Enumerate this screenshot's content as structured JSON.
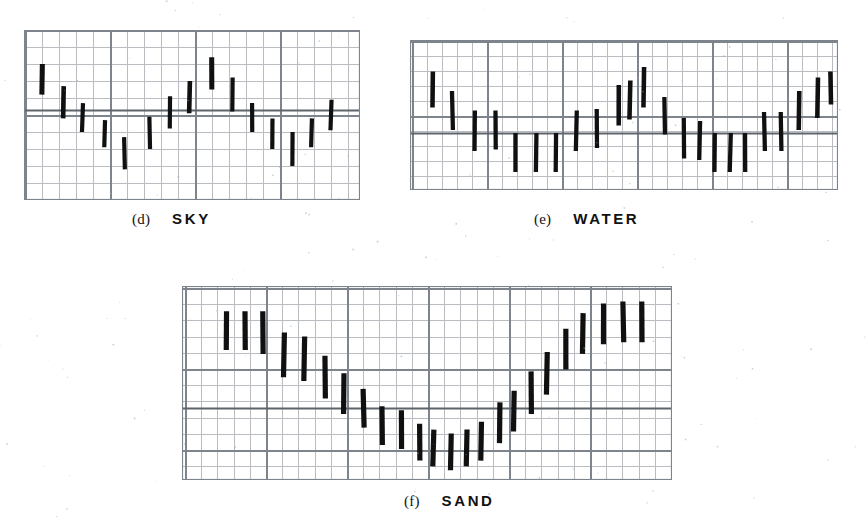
{
  "figure": {
    "background_color": "#ffffff",
    "ink_color": "#101010",
    "grid_minor_color": "#b9bdc2",
    "grid_major_color": "#7e848b",
    "rule_color": "#5e646b"
  },
  "panels": [
    {
      "id": "sky",
      "tag": "(d)",
      "name": "SKY",
      "caption_x": 132,
      "caption_y": 210,
      "box": {
        "x": 24,
        "y": 30,
        "w": 336,
        "h": 170
      },
      "grid": {
        "minor": 17.0,
        "major_every": 5,
        "major_offset_x": 1,
        "major_offset_y": 0
      },
      "baseline_y_frac": 0.47,
      "chart_note": "Vertical range (min-max) bars, one per sample column."
    },
    {
      "id": "water",
      "tag": "(e)",
      "name": "WATER",
      "caption_x": 534,
      "caption_y": 210,
      "box": {
        "x": 410,
        "y": 40,
        "w": 428,
        "h": 150
      },
      "grid": {
        "minor": 15.0,
        "major_every": 5,
        "major_offset_x": 2,
        "major_offset_y": 1
      },
      "baseline_y_frac": 0.62,
      "chart_note": "Vertical range (min-max) bars, one per sample column."
    },
    {
      "id": "sand",
      "tag": "(f)",
      "name": "SAND",
      "caption_x": 404,
      "caption_y": 492,
      "box": {
        "x": 182,
        "y": 286,
        "w": 490,
        "h": 194
      },
      "grid": {
        "minor": 16.2,
        "major_every": 5,
        "major_offset_x": 3,
        "major_offset_y": 2
      },
      "baseline_y_frac": 0.63,
      "chart_note": "Vertical range (min-max) bars, one per sample column; monotone V shape."
    }
  ],
  "chart_data": [
    {
      "id": "sky",
      "type": "bar",
      "title": "SKY",
      "subtitle": "(d)",
      "xlabel": "",
      "ylabel": "",
      "grid": true,
      "legend": "none",
      "bar_style": "vertical range bar (low-high whisker)",
      "ylim": [
        0,
        1
      ],
      "xlim": [
        0,
        20
      ],
      "categories": [
        1,
        2,
        3,
        4,
        5,
        6,
        7,
        8,
        9,
        10,
        11,
        12,
        13,
        14,
        15,
        16,
        17
      ],
      "series": [
        {
          "name": "range_low",
          "values": [
            0.38,
            0.47,
            0.56,
            0.64,
            0.74,
            0.62,
            0.52,
            0.47,
            0.33,
            0.43,
            0.56,
            0.65,
            0.72,
            0.79,
            0.69,
            0.63,
            0.56
          ]
        },
        {
          "name": "range_high",
          "values": [
            0.2,
            0.33,
            0.43,
            0.52,
            0.59,
            0.48,
            0.35,
            0.29,
            0.18,
            0.29,
            0.42,
            0.51,
            0.59,
            0.65,
            0.56,
            0.49,
            0.4
          ]
        }
      ],
      "bars": [
        {
          "x": 0.055,
          "top": 0.2,
          "bottom": 0.38,
          "w": 0.012
        },
        {
          "x": 0.118,
          "top": 0.33,
          "bottom": 0.52,
          "w": 0.011
        },
        {
          "x": 0.175,
          "top": 0.43,
          "bottom": 0.6,
          "w": 0.01
        },
        {
          "x": 0.24,
          "top": 0.53,
          "bottom": 0.69,
          "w": 0.01
        },
        {
          "x": 0.3,
          "top": 0.63,
          "bottom": 0.82,
          "w": 0.01
        },
        {
          "x": 0.375,
          "top": 0.51,
          "bottom": 0.7,
          "w": 0.01
        },
        {
          "x": 0.435,
          "top": 0.39,
          "bottom": 0.58,
          "w": 0.01
        },
        {
          "x": 0.492,
          "top": 0.3,
          "bottom": 0.49,
          "w": 0.011
        },
        {
          "x": 0.558,
          "top": 0.16,
          "bottom": 0.35,
          "w": 0.012
        },
        {
          "x": 0.62,
          "top": 0.28,
          "bottom": 0.48,
          "w": 0.01
        },
        {
          "x": 0.68,
          "top": 0.43,
          "bottom": 0.6,
          "w": 0.01
        },
        {
          "x": 0.74,
          "top": 0.52,
          "bottom": 0.7,
          "w": 0.01
        },
        {
          "x": 0.8,
          "top": 0.6,
          "bottom": 0.8,
          "w": 0.01
        },
        {
          "x": 0.857,
          "top": 0.52,
          "bottom": 0.69,
          "w": 0.01
        },
        {
          "x": 0.915,
          "top": 0.41,
          "bottom": 0.59,
          "w": 0.01
        }
      ]
    },
    {
      "id": "water",
      "type": "bar",
      "title": "WATER",
      "subtitle": "(e)",
      "xlabel": "",
      "ylabel": "",
      "grid": true,
      "legend": "none",
      "bar_style": "vertical range bar (low-high whisker)",
      "ylim": [
        0,
        1
      ],
      "xlim": [
        0,
        24
      ],
      "categories": [
        1,
        2,
        3,
        4,
        5,
        6,
        7,
        8,
        9,
        10,
        11,
        12,
        13,
        14,
        15,
        16,
        17,
        18,
        19,
        20,
        21,
        22
      ],
      "series": [
        {
          "name": "range_low",
          "values": [
            0.48,
            0.6,
            0.74,
            0.76,
            0.88,
            0.87,
            0.87,
            0.76,
            0.74,
            0.56,
            0.52,
            0.64,
            0.83,
            0.84,
            0.83,
            0.88,
            0.88,
            0.88,
            0.74,
            0.74,
            0.6,
            0.53
          ]
        },
        {
          "name": "range_high",
          "values": [
            0.23,
            0.36,
            0.5,
            0.52,
            0.65,
            0.64,
            0.64,
            0.5,
            0.48,
            0.3,
            0.26,
            0.39,
            0.58,
            0.59,
            0.59,
            0.64,
            0.64,
            0.64,
            0.49,
            0.49,
            0.34,
            0.26
          ]
        }
      ],
      "bars": [
        {
          "x": 0.052,
          "top": 0.21,
          "bottom": 0.45,
          "w": 0.0085
        },
        {
          "x": 0.1,
          "top": 0.34,
          "bottom": 0.6,
          "w": 0.008
        },
        {
          "x": 0.152,
          "top": 0.47,
          "bottom": 0.74,
          "w": 0.008
        },
        {
          "x": 0.2,
          "top": 0.47,
          "bottom": 0.73,
          "w": 0.008
        },
        {
          "x": 0.246,
          "top": 0.62,
          "bottom": 0.88,
          "w": 0.008
        },
        {
          "x": 0.294,
          "top": 0.62,
          "bottom": 0.88,
          "w": 0.008
        },
        {
          "x": 0.34,
          "top": 0.62,
          "bottom": 0.88,
          "w": 0.008
        },
        {
          "x": 0.388,
          "top": 0.47,
          "bottom": 0.74,
          "w": 0.008
        },
        {
          "x": 0.436,
          "top": 0.46,
          "bottom": 0.72,
          "w": 0.008
        },
        {
          "x": 0.487,
          "top": 0.3,
          "bottom": 0.57,
          "w": 0.0085
        },
        {
          "x": 0.513,
          "top": 0.27,
          "bottom": 0.53,
          "w": 0.0085
        },
        {
          "x": 0.546,
          "top": 0.18,
          "bottom": 0.45,
          "w": 0.0085
        },
        {
          "x": 0.594,
          "top": 0.38,
          "bottom": 0.63,
          "w": 0.008
        },
        {
          "x": 0.64,
          "top": 0.52,
          "bottom": 0.79,
          "w": 0.008
        },
        {
          "x": 0.676,
          "top": 0.54,
          "bottom": 0.8,
          "w": 0.008
        },
        {
          "x": 0.712,
          "top": 0.62,
          "bottom": 0.88,
          "w": 0.008
        },
        {
          "x": 0.748,
          "top": 0.62,
          "bottom": 0.88,
          "w": 0.008
        },
        {
          "x": 0.784,
          "top": 0.62,
          "bottom": 0.88,
          "w": 0.008
        },
        {
          "x": 0.828,
          "top": 0.48,
          "bottom": 0.74,
          "w": 0.008
        },
        {
          "x": 0.866,
          "top": 0.48,
          "bottom": 0.74,
          "w": 0.008
        },
        {
          "x": 0.908,
          "top": 0.34,
          "bottom": 0.6,
          "w": 0.0085
        },
        {
          "x": 0.952,
          "top": 0.25,
          "bottom": 0.52,
          "w": 0.0085
        },
        {
          "x": 0.982,
          "top": 0.21,
          "bottom": 0.43,
          "w": 0.0085
        }
      ]
    },
    {
      "id": "sand",
      "type": "bar",
      "title": "SAND",
      "subtitle": "(f)",
      "xlabel": "",
      "ylabel": "",
      "grid": true,
      "legend": "none",
      "bar_style": "vertical range bar (low-high whisker)",
      "ylim": [
        0,
        1
      ],
      "xlim": [
        0,
        26
      ],
      "categories": [
        1,
        2,
        3,
        4,
        5,
        6,
        7,
        8,
        9,
        10,
        11,
        12,
        13,
        14,
        15,
        16,
        17,
        18,
        19,
        20,
        21,
        22,
        23,
        24
      ],
      "series": [
        {
          "name": "range_low",
          "values": [
            0.33,
            0.33,
            0.35,
            0.47,
            0.49,
            0.58,
            0.66,
            0.73,
            0.82,
            0.84,
            0.9,
            0.93,
            0.95,
            0.93,
            0.9,
            0.81,
            0.75,
            0.66,
            0.56,
            0.43,
            0.35,
            0.3,
            0.29,
            0.29
          ]
        },
        {
          "name": "range_high",
          "values": [
            0.13,
            0.13,
            0.15,
            0.25,
            0.27,
            0.36,
            0.44,
            0.52,
            0.62,
            0.64,
            0.71,
            0.74,
            0.76,
            0.74,
            0.7,
            0.6,
            0.54,
            0.44,
            0.34,
            0.22,
            0.14,
            0.09,
            0.08,
            0.08
          ]
        }
      ],
      "bars": [
        {
          "x": 0.09,
          "top": 0.13,
          "bottom": 0.33,
          "w": 0.0085
        },
        {
          "x": 0.128,
          "top": 0.13,
          "bottom": 0.33,
          "w": 0.0085
        },
        {
          "x": 0.166,
          "top": 0.13,
          "bottom": 0.35,
          "w": 0.0085
        },
        {
          "x": 0.208,
          "top": 0.24,
          "bottom": 0.47,
          "w": 0.0085
        },
        {
          "x": 0.25,
          "top": 0.26,
          "bottom": 0.49,
          "w": 0.0085
        },
        {
          "x": 0.292,
          "top": 0.36,
          "bottom": 0.58,
          "w": 0.0085
        },
        {
          "x": 0.33,
          "top": 0.45,
          "bottom": 0.66,
          "w": 0.0085
        },
        {
          "x": 0.37,
          "top": 0.53,
          "bottom": 0.73,
          "w": 0.0085
        },
        {
          "x": 0.408,
          "top": 0.62,
          "bottom": 0.82,
          "w": 0.0085
        },
        {
          "x": 0.447,
          "top": 0.64,
          "bottom": 0.84,
          "w": 0.0085
        },
        {
          "x": 0.485,
          "top": 0.71,
          "bottom": 0.9,
          "w": 0.0085
        },
        {
          "x": 0.512,
          "top": 0.74,
          "bottom": 0.93,
          "w": 0.0085
        },
        {
          "x": 0.548,
          "top": 0.76,
          "bottom": 0.95,
          "w": 0.0085
        },
        {
          "x": 0.58,
          "top": 0.74,
          "bottom": 0.93,
          "w": 0.0085
        },
        {
          "x": 0.61,
          "top": 0.7,
          "bottom": 0.9,
          "w": 0.0085
        },
        {
          "x": 0.648,
          "top": 0.6,
          "bottom": 0.81,
          "w": 0.0085
        },
        {
          "x": 0.678,
          "top": 0.54,
          "bottom": 0.75,
          "w": 0.0085
        },
        {
          "x": 0.712,
          "top": 0.44,
          "bottom": 0.66,
          "w": 0.0085
        },
        {
          "x": 0.745,
          "top": 0.34,
          "bottom": 0.56,
          "w": 0.0085
        },
        {
          "x": 0.784,
          "top": 0.22,
          "bottom": 0.43,
          "w": 0.0085
        },
        {
          "x": 0.818,
          "top": 0.14,
          "bottom": 0.35,
          "w": 0.0085
        },
        {
          "x": 0.86,
          "top": 0.09,
          "bottom": 0.3,
          "w": 0.0085
        },
        {
          "x": 0.9,
          "top": 0.08,
          "bottom": 0.29,
          "w": 0.0085
        },
        {
          "x": 0.938,
          "top": 0.08,
          "bottom": 0.29,
          "w": 0.0085
        }
      ]
    }
  ]
}
